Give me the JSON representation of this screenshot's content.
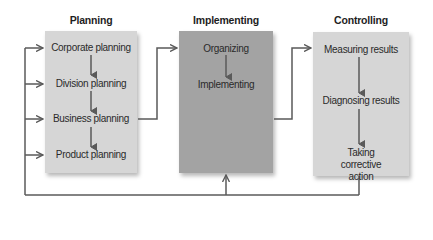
{
  "colors": {
    "planning_box": "#d6d6d6",
    "implementing_box": "#a3a3a3",
    "controlling_box": "#d6d6d6",
    "line": "#5a5a5a"
  },
  "columns": {
    "planning": {
      "title": "Planning",
      "items": [
        "Corporate planning",
        "Division planning",
        "Business planning",
        "Product planning"
      ]
    },
    "implementing": {
      "title": "Implementing",
      "items": [
        "Organizing",
        "Implementing"
      ]
    },
    "controlling": {
      "title": "Controlling",
      "items": [
        "Measuring results",
        "Diagnosing results",
        "Taking corrective action"
      ]
    }
  },
  "flows": [
    {
      "from": "Business planning",
      "to": "Implementing"
    },
    {
      "from": "Implementing",
      "to": "Controlling"
    },
    {
      "from": "Taking corrective action",
      "to": "Planning (all levels) and Implementing",
      "type": "feedback"
    }
  ]
}
